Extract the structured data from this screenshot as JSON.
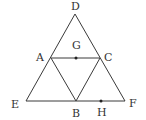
{
  "diagram": {
    "colors": {
      "stroke": "#3a3a3a",
      "label": "#333333",
      "background": "#ffffff"
    },
    "points": {
      "D": {
        "label": "D",
        "x": 75,
        "y": 14
      },
      "E": {
        "label": "E",
        "x": 26,
        "y": 101
      },
      "F": {
        "label": "F",
        "x": 125,
        "y": 101
      },
      "A": {
        "label": "A",
        "x": 51,
        "y": 58
      },
      "C": {
        "label": "C",
        "x": 100,
        "y": 58
      },
      "B": {
        "label": "B",
        "x": 76,
        "y": 101
      },
      "G": {
        "label": "G",
        "x": 76,
        "y": 58
      },
      "H": {
        "label": "H",
        "x": 101,
        "y": 101
      }
    },
    "segments": [
      [
        "D",
        "E"
      ],
      [
        "D",
        "F"
      ],
      [
        "E",
        "F"
      ],
      [
        "A",
        "C"
      ],
      [
        "A",
        "B"
      ],
      [
        "C",
        "B"
      ]
    ],
    "dots": [
      "G",
      "H"
    ]
  }
}
